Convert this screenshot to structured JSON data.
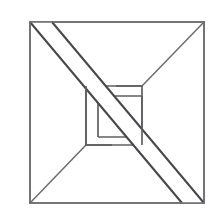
{
  "figure": {
    "label": "3.",
    "caption": "",
    "type": "geometric-line-drawing",
    "canvas": {
      "width": 219,
      "height": 218,
      "background": "#ffffff"
    },
    "colors": {
      "outer_square": "#6e6e72",
      "diagonal": "#6b6b70",
      "inner_square": "#5f5f64",
      "band": "#46464b",
      "faint_diagonal": "#b9b9bd",
      "label_text": "#2b2b2b",
      "paper": "#ffffff"
    },
    "geometry": {
      "outer_square": {
        "x": 30,
        "y": 22,
        "width": 174,
        "height": 181
      },
      "inner_square": {
        "x": 86,
        "y": 86,
        "width": 56,
        "height": 59
      },
      "band": {
        "from_corner": "top-left",
        "to_corner": "bottom-right",
        "width_px": 22,
        "weave": "over-left-under-right"
      },
      "diagonals": [
        {
          "name": "top-right-to-center",
          "from": [
            204,
            22
          ],
          "to": [
            142,
            86
          ]
        },
        {
          "name": "bottom-left-to-center",
          "from": [
            30,
            203
          ],
          "to": [
            86,
            145
          ]
        },
        {
          "name": "faint-anti-diagonal",
          "from": [
            142,
            86
          ],
          "to": [
            86,
            145
          ]
        }
      ]
    }
  }
}
